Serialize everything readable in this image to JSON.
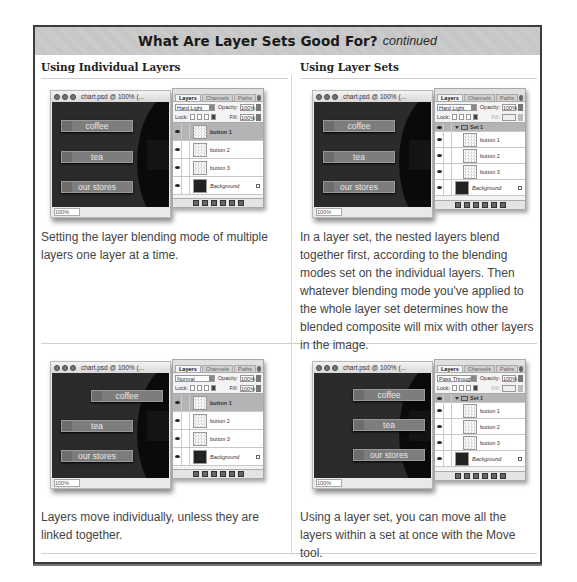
{
  "header": {
    "title": "What Are Layer Sets Good For?",
    "subtitle": "continued"
  },
  "columns": {
    "left_heading": "Using Individual Layers",
    "right_heading": "Using Layer Sets"
  },
  "panels": [
    {
      "position": "row1-left",
      "caption": "Setting the layer blending mode of multiple layers one layer at a time.",
      "document_window": {
        "title": "chart.psd @ 100% (...",
        "zoom": "100%",
        "buttons": [
          "coffee",
          "tea",
          "our stores"
        ]
      },
      "layers_palette": {
        "tabs": [
          "Layers",
          "Channels",
          "Paths"
        ],
        "blend_mode": "Hard Light",
        "opacity_label": "Opacity:",
        "opacity": "100%",
        "lock_label": "Lock:",
        "fill_label": "Fill:",
        "fill": "100%",
        "layers": [
          {
            "name": "button 1",
            "selected": true
          },
          {
            "name": "button 2",
            "selected": false
          },
          {
            "name": "button 3",
            "selected": false
          },
          {
            "name": "Background",
            "selected": false,
            "locked": true
          }
        ]
      }
    },
    {
      "position": "row1-right",
      "caption": "In a layer set, the nested layers blend together first, according to the blending modes set on the individual layers. Then whatever blending mode you've applied to the whole layer set determines how the blended composite will mix with other layers in the image.",
      "document_window": {
        "title": "chart.psd @ 100% (...",
        "zoom": "100%",
        "buttons": [
          "coffee",
          "tea",
          "our stores"
        ]
      },
      "layers_palette": {
        "tabs": [
          "Layers",
          "Channels",
          "Paths"
        ],
        "blend_mode": "Hard Light",
        "opacity_label": "Opacity:",
        "opacity": "100%",
        "lock_label": "Lock:",
        "fill_label": "Fill:",
        "fill": "",
        "set_name": "Set 1",
        "layers": [
          {
            "name": "button 1",
            "selected": false
          },
          {
            "name": "button 2",
            "selected": false
          },
          {
            "name": "button 3",
            "selected": false
          },
          {
            "name": "Background",
            "selected": false,
            "locked": true
          }
        ]
      }
    },
    {
      "position": "row2-left",
      "caption": "Layers move individually, unless they are linked together.",
      "document_window": {
        "title": "chart.psd @ 100% (...",
        "zoom": "100%",
        "buttons": [
          "coffee",
          "tea",
          "our stores"
        ]
      },
      "layers_palette": {
        "tabs": [
          "Layers",
          "Channels",
          "Paths"
        ],
        "blend_mode": "Normal",
        "opacity_label": "Opacity:",
        "opacity": "100%",
        "lock_label": "Lock:",
        "fill_label": "Fill:",
        "fill": "100%",
        "layers": [
          {
            "name": "button 1",
            "selected": true
          },
          {
            "name": "button 2",
            "selected": false
          },
          {
            "name": "button 3",
            "selected": false
          },
          {
            "name": "Background",
            "selected": false,
            "locked": true
          }
        ]
      }
    },
    {
      "position": "row2-right",
      "caption": "Using a layer set, you can move all the layers within a set at once with the Move tool.",
      "document_window": {
        "title": "chart.psd @ 100% (...",
        "zoom": "100%",
        "buttons": [
          "coffee",
          "tea",
          "our stores"
        ]
      },
      "layers_palette": {
        "tabs": [
          "Layers",
          "Channels",
          "Paths"
        ],
        "blend_mode": "Pass Through",
        "opacity_label": "Opacity:",
        "opacity": "100%",
        "lock_label": "Lock:",
        "fill_label": "Fill:",
        "fill": "",
        "set_name": "Set 1",
        "layers": [
          {
            "name": "button 1",
            "selected": false
          },
          {
            "name": "button 2",
            "selected": false
          },
          {
            "name": "button 3",
            "selected": false
          },
          {
            "name": "Background",
            "selected": false,
            "locked": true
          }
        ]
      }
    }
  ]
}
